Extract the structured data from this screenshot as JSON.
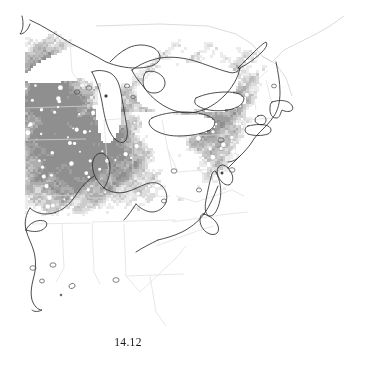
{
  "figure": {
    "caption": "14.12",
    "caption_position": "below-center-left",
    "background_color": "#ffffff",
    "width": 378,
    "height": 381
  },
  "map": {
    "title": "",
    "projection_hint": "conic",
    "region": "Eastern United States and southeastern Canada",
    "data_type": "gridded-raster-choropleth",
    "colors": {
      "background": "#ffffff",
      "water": "#ffffff",
      "coastline": "#2b2b2b",
      "state_border": "#d8d8d8",
      "country_border": "#d0d0d0",
      "marker": "#555555",
      "shade_none": "#ffffff",
      "shade_very_light": "#ececec",
      "shade_light": "#dcdcdc",
      "shade_medium_light": "#cbcbcb",
      "shade_medium": "#bdbdbd",
      "shade_medium_dark": "#adadad",
      "shade_dark": "#9e9e9e",
      "shade_very_dark": "#8f8f8f"
    },
    "legend": {
      "visible": false,
      "entries": []
    },
    "axes": {
      "visible": false,
      "tick_labels": []
    },
    "data_extent": {
      "left_px": 25,
      "right_px": 310,
      "top_px": 35,
      "bottom_px": 255,
      "note": "raster grid clipped to a straight vertical western edge"
    },
    "features": [
      {
        "name": "Lake Superior",
        "type": "lake",
        "shading": "none"
      },
      {
        "name": "Lake Michigan",
        "type": "lake",
        "shading": "none"
      },
      {
        "name": "Lake Huron",
        "type": "lake",
        "shading": "none"
      },
      {
        "name": "Lake Erie",
        "type": "lake",
        "shading": "none"
      },
      {
        "name": "Lake Ontario",
        "type": "lake",
        "shading": "none"
      },
      {
        "name": "Atlantic Ocean",
        "type": "ocean",
        "shading": "none"
      },
      {
        "name": "Gulf of Mexico",
        "type": "ocean",
        "shading": "none"
      },
      {
        "name": "Mississippi River",
        "type": "river",
        "shading": "none"
      },
      {
        "name": "Ohio River",
        "type": "river",
        "shading": "none"
      },
      {
        "name": "Cape Cod",
        "type": "coast",
        "shading": "none"
      },
      {
        "name": "Chesapeake Bay",
        "type": "bay",
        "shading": "none"
      },
      {
        "name": "Appalachian corridor",
        "type": "low-density-band",
        "shading": "none"
      }
    ]
  },
  "chart_data": {
    "type": "heatmap",
    "title": "",
    "subtitle": "",
    "xlabel": "",
    "ylabel": "",
    "grid": false,
    "legend": null,
    "value_label": "relative density (grayscale intensity)",
    "scale_direction": "darker = higher value",
    "bins": [
      {
        "label": "0 (absent)",
        "color": "#ffffff",
        "approx_value": 0.0
      },
      {
        "label": "very low",
        "color": "#ececec",
        "approx_value": 0.15
      },
      {
        "label": "low",
        "color": "#dcdcdc",
        "approx_value": 0.3
      },
      {
        "label": "moderate",
        "color": "#cbcbcb",
        "approx_value": 0.45
      },
      {
        "label": "medium",
        "color": "#bdbdbd",
        "approx_value": 0.6
      },
      {
        "label": "high",
        "color": "#adadad",
        "approx_value": 0.75
      },
      {
        "label": "very high",
        "color": "#9e9e9e",
        "approx_value": 0.88
      },
      {
        "label": "maximum",
        "color": "#8f8f8f",
        "approx_value": 1.0
      }
    ],
    "regional_summary": [
      {
        "region": "Upper Midwest / Iowa / Minnesota",
        "intensity": "very high",
        "value": 0.9
      },
      {
        "region": "Illinois / Indiana / Ohio",
        "intensity": "high",
        "value": 0.75
      },
      {
        "region": "Wisconsin / Upper Michigan",
        "intensity": "very low",
        "value": 0.15
      },
      {
        "region": "Lower Michigan",
        "intensity": "low",
        "value": 0.3
      },
      {
        "region": "Pennsylvania / New York",
        "intensity": "medium",
        "value": 0.6
      },
      {
        "region": "New England",
        "intensity": "moderate",
        "value": 0.45
      },
      {
        "region": "Appalachian spine",
        "intensity": "0 (absent)",
        "value": 0.0
      },
      {
        "region": "Southeast / Gulf states",
        "intensity": "0 (absent)",
        "value": 0.0
      },
      {
        "region": "Atlantic coastal plain (mid)",
        "intensity": "low",
        "value": 0.3
      }
    ]
  }
}
